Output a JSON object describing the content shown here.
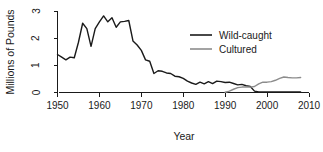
{
  "chart_data": {
    "type": "line",
    "title": "",
    "xlabel": "Year",
    "ylabel": "Millions of Pounds",
    "xlim": [
      1950,
      2010
    ],
    "ylim": [
      0,
      3
    ],
    "xticks": [
      1950,
      1960,
      1970,
      1980,
      1990,
      2000,
      2010
    ],
    "yticks": [
      0,
      1,
      2,
      3
    ],
    "grid": false,
    "legend_position": "upper-right",
    "series": [
      {
        "name": "Wild-caught",
        "color": "#1a1a1a",
        "x": [
          1950,
          1951,
          1952,
          1953,
          1954,
          1955,
          1956,
          1957,
          1958,
          1959,
          1960,
          1961,
          1962,
          1963,
          1964,
          1965,
          1966,
          1967,
          1968,
          1969,
          1970,
          1971,
          1972,
          1973,
          1974,
          1975,
          1976,
          1977,
          1978,
          1979,
          1980,
          1981,
          1982,
          1983,
          1984,
          1985,
          1986,
          1987,
          1988,
          1989,
          1990,
          1991,
          1992,
          1993,
          1994,
          1995,
          1996,
          1997,
          1998,
          1999,
          2000,
          2001,
          2002,
          2003,
          2004,
          2005,
          2006,
          2007,
          2008
        ],
        "values": [
          1.4,
          1.3,
          1.2,
          1.3,
          1.28,
          1.85,
          2.55,
          2.35,
          1.7,
          2.35,
          2.6,
          2.82,
          2.6,
          2.75,
          2.4,
          2.6,
          2.62,
          2.65,
          1.9,
          1.75,
          1.55,
          1.2,
          1.15,
          0.7,
          0.8,
          0.78,
          0.72,
          0.7,
          0.6,
          0.58,
          0.52,
          0.42,
          0.35,
          0.3,
          0.38,
          0.32,
          0.4,
          0.33,
          0.42,
          0.4,
          0.37,
          0.38,
          0.33,
          0.28,
          0.3,
          0.25,
          0.22,
          0.05,
          0.02,
          0.02,
          0.02,
          0.02,
          0.02,
          0.02,
          0.02,
          0.02,
          0.02,
          0.02,
          0.02
        ]
      },
      {
        "name": "Cultured",
        "color": "#8c8c8c",
        "x": [
          1990,
          1991,
          1992,
          1993,
          1994,
          1995,
          1996,
          1997,
          1998,
          1999,
          2000,
          2001,
          2002,
          2003,
          2004,
          2005,
          2006,
          2007,
          2008
        ],
        "values": [
          0.01,
          0.05,
          0.12,
          0.18,
          0.2,
          0.2,
          0.2,
          0.22,
          0.32,
          0.38,
          0.38,
          0.4,
          0.45,
          0.52,
          0.57,
          0.55,
          0.54,
          0.54,
          0.55
        ]
      }
    ]
  },
  "legend": {
    "items": [
      {
        "label": "Wild-caught",
        "color": "#1a1a1a"
      },
      {
        "label": "Cultured",
        "color": "#8c8c8c"
      }
    ]
  },
  "axes": {
    "x_title": "Year",
    "y_title": "Millions of Pounds",
    "x_tick_labels": [
      "1950",
      "1960",
      "1970",
      "1980",
      "1990",
      "2000",
      "2010"
    ],
    "y_tick_labels": [
      "0",
      "1",
      "2",
      "3"
    ]
  }
}
